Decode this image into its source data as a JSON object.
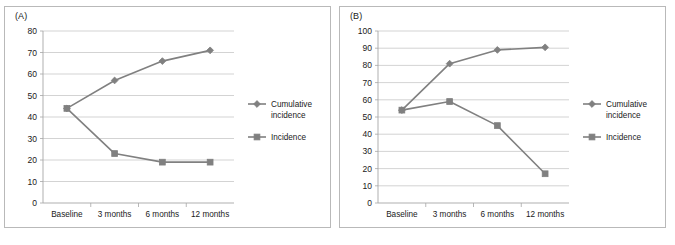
{
  "figure": {
    "background": "#ffffff",
    "panel_border_color": "#b9b9b9",
    "series_color": "#808080",
    "gridline_color": "#c8c8c8",
    "axis_color": "#a6a6a6",
    "text_color": "#1a1a1a"
  },
  "panels": [
    {
      "label": "(A)",
      "label_name": "panel-a-label"
    },
    {
      "label": "(B)",
      "label_name": "panel-b-label"
    }
  ],
  "chart_data": [
    {
      "type": "line",
      "title": "(A)",
      "xlabel": "",
      "ylabel": "",
      "categories": [
        "Baseline",
        "3 months",
        "6 months",
        "12 months"
      ],
      "ylim": [
        0,
        80
      ],
      "yticks": [
        0,
        10,
        20,
        30,
        40,
        50,
        60,
        70,
        80
      ],
      "ytick_labels": [
        "0",
        "10",
        "20",
        "30",
        "40",
        "50",
        "60",
        "70",
        "80"
      ],
      "grid": true,
      "legend_position": "right",
      "series": [
        {
          "name": "Cumulative incidence",
          "marker": "diamond",
          "color": "#808080",
          "values": [
            44,
            57,
            66,
            71
          ]
        },
        {
          "name": "Incidence",
          "marker": "square",
          "color": "#808080",
          "values": [
            44,
            23,
            19,
            19
          ]
        }
      ]
    },
    {
      "type": "line",
      "title": "(B)",
      "xlabel": "",
      "ylabel": "",
      "categories": [
        "Baseline",
        "3 months",
        "6 months",
        "12 months"
      ],
      "ylim": [
        0,
        100
      ],
      "yticks": [
        0,
        10,
        20,
        30,
        40,
        50,
        60,
        70,
        80,
        90,
        100
      ],
      "ytick_labels": [
        "0",
        "10",
        "20",
        "30",
        "40",
        "50",
        "60",
        "70",
        "80",
        "90",
        "100"
      ],
      "grid": true,
      "legend_position": "right",
      "series": [
        {
          "name": "Cumulative incidence",
          "marker": "diamond",
          "color": "#808080",
          "values": [
            54,
            81,
            89,
            90.5
          ]
        },
        {
          "name": "Incidence",
          "marker": "square",
          "color": "#808080",
          "values": [
            54,
            59,
            45,
            17
          ]
        }
      ]
    }
  ],
  "legend": {
    "entries": [
      {
        "label": "Cumulative incidence",
        "line1": "Cumulative",
        "line2": "incidence",
        "marker": "diamond"
      },
      {
        "label": "Incidence",
        "line1": "Incidence",
        "line2": "",
        "marker": "square"
      }
    ]
  }
}
